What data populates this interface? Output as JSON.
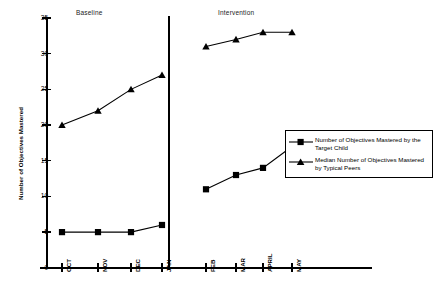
{
  "chart_data": {
    "type": "line",
    "title": "",
    "xlabel": "",
    "ylabel": "Number of Objectives Mastered",
    "ylim": [
      0,
      35
    ],
    "grid": false,
    "legend_position": "right-middle",
    "phases": [
      {
        "name": "Baseline",
        "categories": [
          "OCT",
          "NOV",
          "DEC",
          "JAN"
        ]
      },
      {
        "name": "Intervention",
        "categories": [
          "FEB",
          "MAR",
          "APRIL",
          "MAY"
        ]
      }
    ],
    "categories": [
      "OCT",
      "NOV",
      "DEC",
      "JAN",
      "FEB",
      "MAR",
      "APRIL",
      "MAY"
    ],
    "yticks": [
      0,
      5,
      10,
      15,
      20,
      25,
      30,
      35
    ],
    "series": [
      {
        "name": "Number of Objectives Mastered by the Target Child",
        "marker": "square",
        "color": "#000000",
        "values": [
          5,
          5,
          5,
          6,
          11,
          13,
          14,
          17
        ]
      },
      {
        "name": "Median Number of Objectives Mastered by Typical Peers",
        "marker": "triangle",
        "color": "#000000",
        "values": [
          20,
          22,
          25,
          27,
          31,
          32,
          33,
          33
        ]
      }
    ],
    "annotations": [
      "Baseline",
      "Intervention"
    ]
  },
  "axis": {
    "y_title": "Number of Objectives Mastered",
    "y_tick_labels": [
      "0",
      "5",
      "10",
      "15",
      "20",
      "25",
      "30",
      "35"
    ],
    "x_tick_labels": [
      "OCT",
      "NOV",
      "DEC",
      "JAN",
      "FEB",
      "MAR",
      "APRIL",
      "MAY"
    ]
  },
  "phase_labels": {
    "baseline": "Baseline",
    "intervention": "Intervention"
  },
  "legend": {
    "entries": [
      {
        "marker": "square",
        "line1": "Number of Objectives Mastered by the",
        "line2": "Target Child"
      },
      {
        "marker": "triangle",
        "line1": "Median Number of Objectives Mastered",
        "line2": "by Typical Peers"
      }
    ]
  }
}
